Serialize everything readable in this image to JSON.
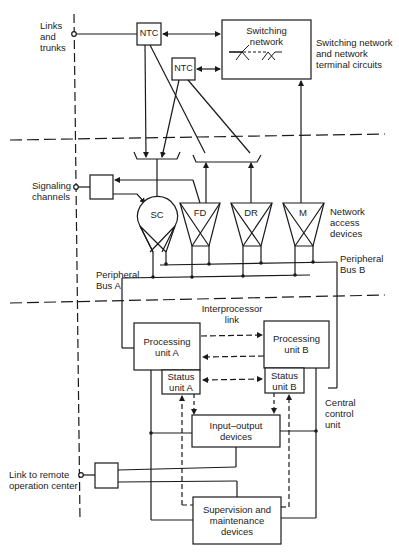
{
  "diagram": {
    "external_labels": {
      "links_and_trunks": [
        "Links",
        "and",
        "trunks"
      ],
      "signaling_channels": [
        "Signaling",
        "channels"
      ],
      "link_to_remote": [
        "Link to remote",
        "operation center"
      ]
    },
    "section_labels": {
      "switching_network_section": [
        "Switching network",
        "and network",
        "terminal circuits"
      ],
      "network_access_section": [
        "Network",
        "access",
        "devices"
      ],
      "central_control_section": [
        "Central",
        "control",
        "unit"
      ]
    },
    "blocks": {
      "ntc_1": "NTC",
      "ntc_2": "NTC",
      "switching_network": [
        "Switching",
        "network"
      ],
      "processing_unit_a": [
        "Processing",
        "unit A"
      ],
      "processing_unit_b": [
        "Processing",
        "unit B"
      ],
      "status_unit_a": [
        "Status",
        "unit A"
      ],
      "status_unit_b": [
        "Status",
        "unit B"
      ],
      "input_output": [
        "Input–output",
        "devices"
      ],
      "supervision": [
        "Supervision and",
        "maintenance",
        "devices"
      ]
    },
    "access_devices": {
      "sc": "SC",
      "fd": "FD",
      "dr": "DR",
      "m": "M"
    },
    "bus_labels": {
      "bus_a": [
        "Peripheral",
        "Bus A"
      ],
      "bus_b": [
        "Peripheral",
        "Bus B"
      ],
      "interprocessor": [
        "Interprocessor",
        "link"
      ]
    },
    "colors": {
      "line": "#1a1a1a",
      "background": "#ffffff"
    }
  }
}
